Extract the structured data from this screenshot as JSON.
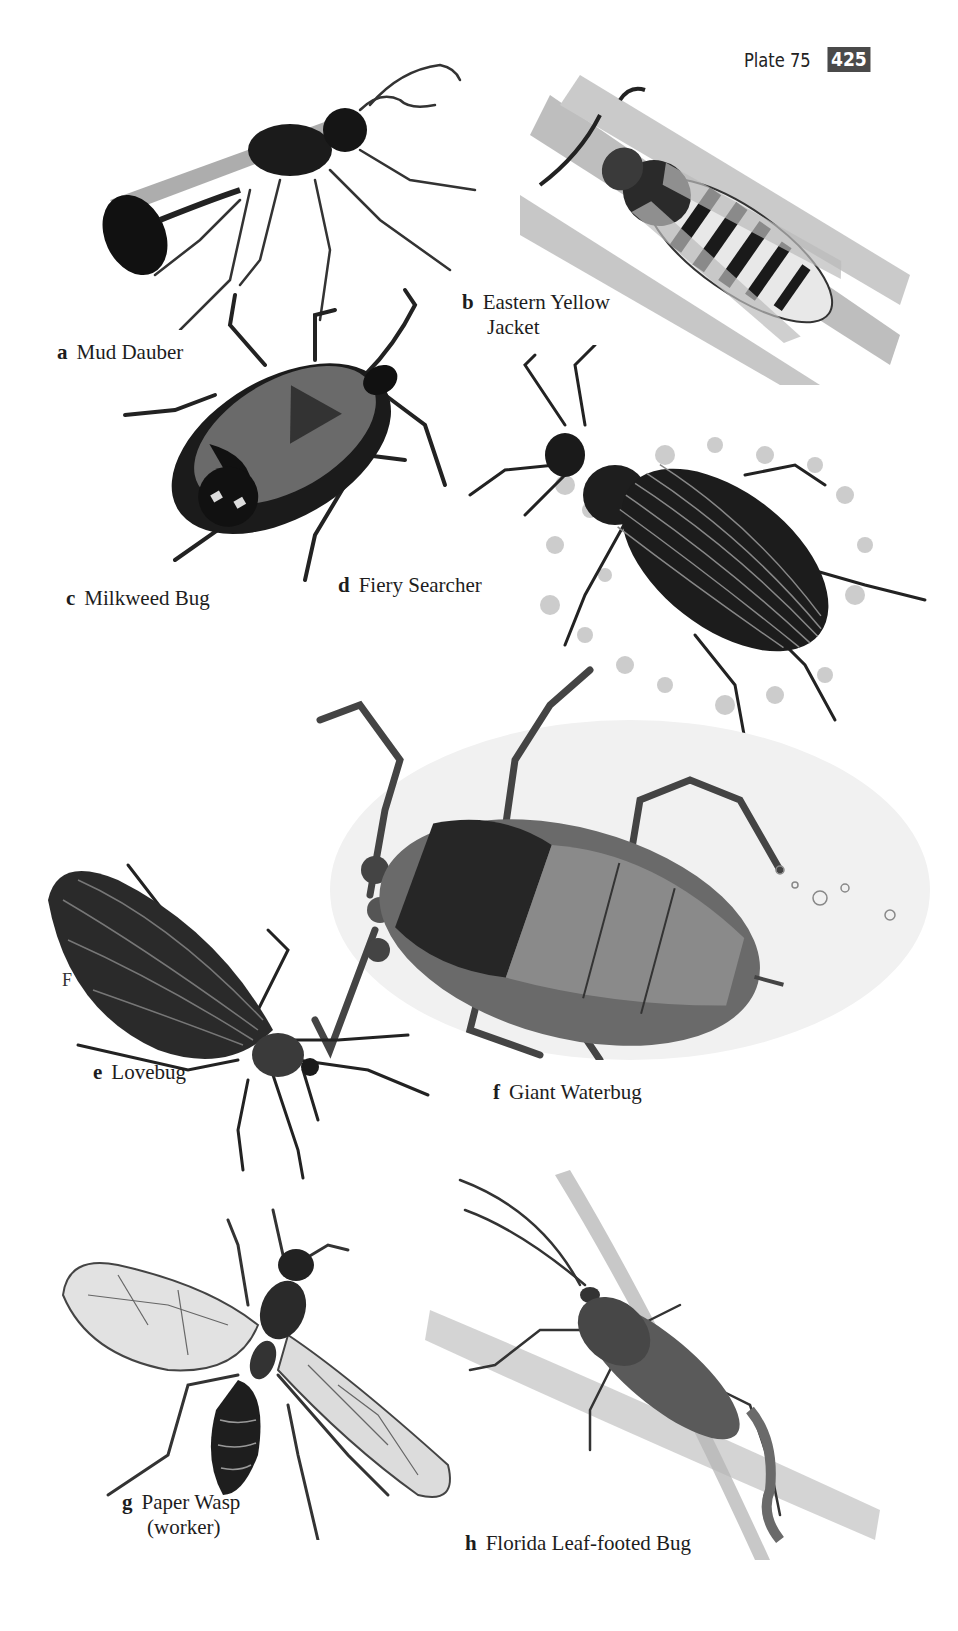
{
  "header": {
    "plate": "Plate 75",
    "page_number": "425"
  },
  "margin_mark": "F",
  "plates": [
    {
      "letter": "a",
      "name": "Mud Dauber",
      "name_line2": ""
    },
    {
      "letter": "b",
      "name": "Eastern Yellow",
      "name_line2": "Jacket"
    },
    {
      "letter": "c",
      "name": "Milkweed Bug",
      "name_line2": ""
    },
    {
      "letter": "d",
      "name": "Fiery Searcher",
      "name_line2": ""
    },
    {
      "letter": "e",
      "name": "Lovebug",
      "name_line2": ""
    },
    {
      "letter": "f",
      "name": "Giant Waterbug",
      "name_line2": ""
    },
    {
      "letter": "g",
      "name": "Paper Wasp",
      "name_line2": "(worker)"
    },
    {
      "letter": "h",
      "name": "Florida Leaf-footed Bug",
      "name_line2": ""
    }
  ],
  "colors": {
    "ink": "#1a1a1a",
    "badge": "#4a4a4a",
    "paper": "#ffffff"
  }
}
